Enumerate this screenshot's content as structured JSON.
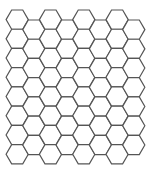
{
  "pattern": {
    "type": "hexagon-grid",
    "orientation": "flat-top",
    "columns": 8,
    "rows_even_columns": 8,
    "rows_odd_columns": 7,
    "stroke_color": "#555555",
    "fill_color": "#ffffff",
    "background": "#ffffff"
  }
}
